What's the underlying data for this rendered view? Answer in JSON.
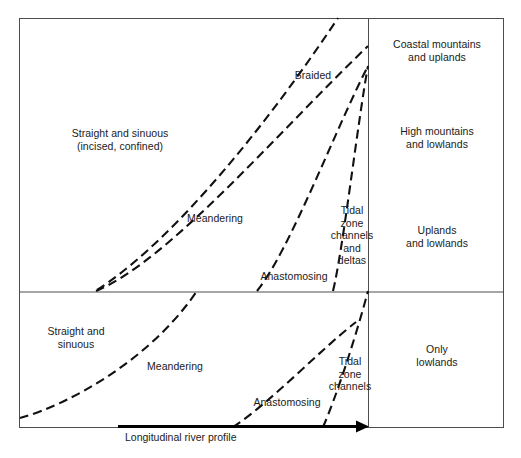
{
  "figure": {
    "type": "conceptual-diagram",
    "axis_label": "Longitudinal river profile",
    "frame": {
      "left": 19,
      "top": 18,
      "right": 503,
      "bottom": 427,
      "mid_horizontal_y": 292,
      "mid_vertical_x": 368
    },
    "upper_section": {
      "zone_labels": [
        {
          "id": "straight-sinuous-incised",
          "text": "Straight and sinuous\n(incised, confined)",
          "x": 120,
          "y": 127
        },
        {
          "id": "braided",
          "text": "Braided",
          "x": 313,
          "y": 75
        },
        {
          "id": "meandering",
          "text": "Meandering",
          "x": 215,
          "y": 218
        },
        {
          "id": "anastomosing",
          "text": "Anastomosing",
          "x": 294,
          "y": 276
        },
        {
          "id": "tidal-zone-channels-deltas",
          "text": "Tidal\nzone\nchannels\nand\ndeltas",
          "x": 352,
          "y": 236
        }
      ],
      "right_labels": [
        {
          "id": "coastal-mountains-uplands",
          "text": "Coastal mountains\nand uplands",
          "x": 437,
          "y": 50
        },
        {
          "id": "high-mountains-lowlands",
          "text": "High mountains\nand lowlands",
          "x": 437,
          "y": 137
        },
        {
          "id": "uplands-lowlands",
          "text": "Uplands\nand lowlands",
          "x": 437,
          "y": 236
        }
      ]
    },
    "lower_section": {
      "zone_labels": [
        {
          "id": "straight-sinuous",
          "text": "Straight and\nsinuous",
          "x": 76,
          "y": 337
        },
        {
          "id": "meandering-lower",
          "text": "Meandering",
          "x": 175,
          "y": 366
        },
        {
          "id": "anastomosing-lower",
          "text": "Anastomosing",
          "x": 287,
          "y": 402
        },
        {
          "id": "tidal-zone-channels",
          "text": "Tidal\nzone\nchannels",
          "x": 350,
          "y": 373
        }
      ],
      "right_labels": [
        {
          "id": "only-lowlands",
          "text": "Only\nlowlands",
          "x": 437,
          "y": 355
        }
      ]
    },
    "boundary_curves": [
      {
        "id": "upper-boundary-straight-meandering-a",
        "d": "M 97 290 C 160 250, 250 150, 338 18"
      },
      {
        "id": "upper-boundary-straight-meandering-b",
        "d": "M 96 291 C 170 260, 280 130, 368 46"
      },
      {
        "id": "upper-boundary-meandering-anastomosing",
        "d": "M 257 291 C 290 250, 335 130, 368 66"
      },
      {
        "id": "upper-boundary-anastomosing-tidal",
        "d": "M 333 291 C 343 250, 358 120, 368 66"
      },
      {
        "id": "lower-boundary-straight-meandering",
        "d": "M 20 418 C 70 404, 150 360, 197 291"
      },
      {
        "id": "lower-boundary-meandering-anastomosing",
        "d": "M 233 427 C 270 403, 320 350, 356 322"
      },
      {
        "id": "lower-boundary-anastomosing-tidal",
        "d": "M 323 427 C 335 400, 355 340, 368 291"
      }
    ],
    "colors": {
      "frame": "#4d4d4d",
      "curve": "#111111",
      "arrow": "#000000",
      "text": "#1a1a1a",
      "background": "#ffffff"
    }
  }
}
